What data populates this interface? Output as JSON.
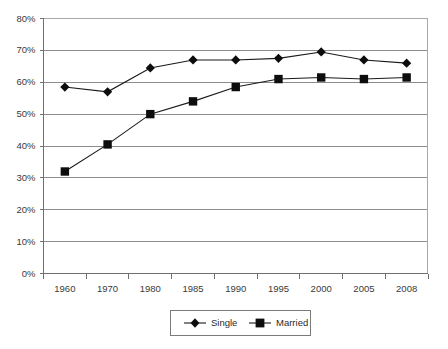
{
  "chart_data": {
    "type": "line",
    "title": "",
    "subtitle": "",
    "xlabel": "",
    "ylabel": "",
    "categories": [
      "1960",
      "1970",
      "1980",
      "1985",
      "1990",
      "1995",
      "2000",
      "2005",
      "2008"
    ],
    "series": [
      {
        "name": "Single",
        "marker": "diamond",
        "color": "#0d0d0d",
        "values": [
          58.5,
          57.0,
          64.5,
          67.0,
          67.0,
          67.5,
          69.5,
          67.0,
          66.0
        ]
      },
      {
        "name": "Married",
        "marker": "square",
        "color": "#0d0d0d",
        "values": [
          32.0,
          40.5,
          50.0,
          54.0,
          58.5,
          61.0,
          61.5,
          61.0,
          61.5
        ]
      }
    ],
    "ylim": [
      0,
      80
    ],
    "ytick_step": 10,
    "ytick_labels": [
      "0%",
      "10%",
      "20%",
      "30%",
      "40%",
      "50%",
      "60%",
      "70%",
      "80%"
    ],
    "ytick_values": [
      0,
      10,
      20,
      30,
      40,
      50,
      60,
      70,
      80
    ],
    "grid": true,
    "grid_axis": "y",
    "legend_position": "bottom",
    "legend_entries": [
      "Single",
      "Married"
    ],
    "value_suffix": "%"
  },
  "colors": {
    "background": "#ffffff",
    "gridline": "#8c8c8c",
    "axis": "#6f6f6f",
    "plot_border": "#a8a8a8",
    "series": "#0d0d0d",
    "text": "#2b2b2b"
  }
}
